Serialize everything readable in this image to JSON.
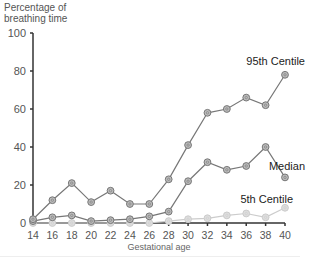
{
  "chart_data": {
    "type": "line",
    "title": "",
    "xlabel": "Gestational age",
    "ylabel": "Percentage of breathing time",
    "ylabel_lines": [
      "Percentage of",
      "breathing time"
    ],
    "x": [
      14,
      16,
      18,
      20,
      22,
      24,
      26,
      28,
      30,
      32,
      34,
      36,
      38,
      40
    ],
    "x_ticks": [
      "14",
      "16",
      "18",
      "20",
      "22",
      "24",
      "26",
      "28",
      "30",
      "32",
      "34",
      "36",
      "38",
      "40"
    ],
    "y_ticks": [
      "0",
      "20",
      "40",
      "60",
      "80",
      "100"
    ],
    "ylim": [
      0,
      100
    ],
    "xlim": [
      14,
      40
    ],
    "grid": false,
    "legend": "inline labels at right end of each series",
    "series": [
      {
        "name": "95th Centile",
        "color": "#777777",
        "marker_fill": "#bbbbbb",
        "values": [
          2,
          12,
          21,
          11,
          17,
          10,
          10,
          23,
          41,
          58,
          60,
          66,
          62,
          78
        ]
      },
      {
        "name": "Median",
        "color": "#777777",
        "marker_fill": "#bbbbbb",
        "values": [
          1,
          3,
          4,
          1,
          1.5,
          2,
          3.5,
          6,
          22,
          32,
          28,
          30,
          40,
          24
        ]
      },
      {
        "name": "5th Centile",
        "color": "#cccccc",
        "marker_fill": "#dddddd",
        "values": [
          0,
          0,
          0,
          0,
          0,
          0,
          0,
          1,
          2,
          2.5,
          4,
          5,
          3,
          8
        ]
      }
    ],
    "annotations": [
      "95th Centile",
      "Median",
      "5th Centile"
    ]
  }
}
